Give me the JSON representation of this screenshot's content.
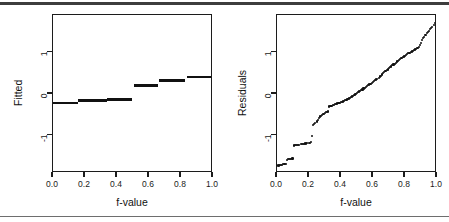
{
  "figure": {
    "background_color": "#ffffff",
    "ink_color": "#111111",
    "top_rule_color": "#3d3d3d",
    "bottom_rule_color": "#6e6e6e"
  },
  "panels": [
    {
      "name": "fitted-panel",
      "xlabel": "f-value",
      "ylabel": "Fitted",
      "x_ticks": [
        "0.0",
        "0.2",
        "0.4",
        "0.6",
        "0.8",
        "1.0"
      ],
      "y_ticks": [
        "1",
        "0",
        "-1"
      ]
    },
    {
      "name": "residuals-panel",
      "xlabel": "f-value",
      "ylabel": "Residuals",
      "x_ticks": [
        "0.0",
        "0.2",
        "0.4",
        "0.6",
        "0.8",
        "1.0"
      ],
      "y_ticks": [
        "1",
        "0",
        "-1"
      ]
    }
  ],
  "chart_data": [
    {
      "type": "line",
      "name": "fitted-panel",
      "title": "",
      "xlabel": "f-value",
      "ylabel": "Fitted",
      "xlim": [
        0.0,
        1.0
      ],
      "ylim": [
        -1.9,
        1.9
      ],
      "x_ticks": [
        0.0,
        0.2,
        0.4,
        0.6,
        0.8,
        1.0
      ],
      "y_ticks": [
        1,
        0,
        -1
      ],
      "grid": false,
      "legend": "none",
      "style": "step-segments",
      "segments": [
        {
          "x0": 0.0,
          "x1": 0.155,
          "y": -0.22
        },
        {
          "x0": 0.155,
          "x1": 0.335,
          "y": -0.16
        },
        {
          "x0": 0.335,
          "x1": 0.495,
          "y": -0.13
        },
        {
          "x0": 0.505,
          "x1": 0.655,
          "y": 0.2
        },
        {
          "x0": 0.665,
          "x1": 0.825,
          "y": 0.33
        },
        {
          "x0": 0.835,
          "x1": 1.0,
          "y": 0.41
        }
      ]
    },
    {
      "type": "scatter",
      "name": "residuals-panel",
      "title": "",
      "xlabel": "f-value",
      "ylabel": "Residuals",
      "xlim": [
        0.0,
        1.0
      ],
      "ylim": [
        -1.9,
        1.9
      ],
      "x_ticks": [
        0.0,
        0.2,
        0.4,
        0.6,
        0.8,
        1.0
      ],
      "y_ticks": [
        1,
        0,
        -1
      ],
      "grid": false,
      "legend": "none",
      "x": [
        0.005,
        0.012,
        0.019,
        0.026,
        0.033,
        0.04,
        0.047,
        0.054,
        0.062,
        0.069,
        0.076,
        0.083,
        0.09,
        0.097,
        0.105,
        0.112,
        0.119,
        0.126,
        0.133,
        0.14,
        0.148,
        0.155,
        0.162,
        0.169,
        0.176,
        0.183,
        0.19,
        0.198,
        0.205,
        0.212,
        0.219,
        0.226,
        0.233,
        0.24,
        0.248,
        0.255,
        0.262,
        0.269,
        0.276,
        0.283,
        0.291,
        0.298,
        0.305,
        0.312,
        0.319,
        0.326,
        0.334,
        0.341,
        0.348,
        0.355,
        0.362,
        0.369,
        0.377,
        0.384,
        0.391,
        0.398,
        0.405,
        0.412,
        0.42,
        0.427,
        0.434,
        0.441,
        0.448,
        0.455,
        0.463,
        0.47,
        0.477,
        0.484,
        0.491,
        0.498,
        0.506,
        0.513,
        0.52,
        0.527,
        0.534,
        0.541,
        0.549,
        0.556,
        0.563,
        0.57,
        0.577,
        0.584,
        0.592,
        0.599,
        0.606,
        0.613,
        0.62,
        0.627,
        0.635,
        0.642,
        0.649,
        0.656,
        0.663,
        0.67,
        0.678,
        0.685,
        0.692,
        0.699,
        0.706,
        0.713,
        0.721,
        0.728,
        0.735,
        0.742,
        0.749,
        0.756,
        0.764,
        0.771,
        0.778,
        0.785,
        0.792,
        0.799,
        0.807,
        0.814,
        0.821,
        0.828,
        0.835,
        0.842,
        0.85,
        0.857,
        0.864,
        0.871,
        0.878,
        0.885,
        0.893,
        0.9,
        0.907,
        0.914,
        0.921,
        0.928,
        0.936,
        0.943,
        0.95,
        0.957,
        0.964,
        0.971,
        0.979,
        0.986,
        0.993
      ],
      "y": [
        -1.72,
        -1.72,
        -1.71,
        -1.71,
        -1.7,
        -1.69,
        -1.69,
        -1.68,
        -1.58,
        -1.57,
        -1.57,
        -1.56,
        -1.56,
        -1.55,
        -1.24,
        -1.23,
        -1.23,
        -1.22,
        -1.22,
        -1.22,
        -1.21,
        -1.21,
        -1.2,
        -1.2,
        -1.19,
        -1.19,
        -1.18,
        -1.18,
        -1.17,
        -1.16,
        -1.02,
        -0.74,
        -0.72,
        -0.7,
        -0.66,
        -0.62,
        -0.58,
        -0.54,
        -0.52,
        -0.5,
        -0.48,
        -0.46,
        -0.44,
        -0.43,
        -0.42,
        -0.3,
        -0.29,
        -0.28,
        -0.27,
        -0.26,
        -0.25,
        -0.24,
        -0.23,
        -0.22,
        -0.21,
        -0.2,
        -0.19,
        -0.18,
        -0.16,
        -0.15,
        -0.14,
        -0.12,
        -0.11,
        -0.09,
        -0.07,
        -0.06,
        -0.04,
        -0.02,
        0.0,
        0.02,
        0.04,
        0.06,
        0.07,
        0.09,
        0.11,
        0.13,
        0.15,
        0.17,
        0.19,
        0.21,
        0.23,
        0.25,
        0.27,
        0.29,
        0.31,
        0.33,
        0.35,
        0.37,
        0.39,
        0.42,
        0.44,
        0.47,
        0.5,
        0.52,
        0.55,
        0.57,
        0.59,
        0.62,
        0.64,
        0.66,
        0.69,
        0.71,
        0.73,
        0.75,
        0.78,
        0.8,
        0.82,
        0.84,
        0.86,
        0.88,
        0.9,
        0.92,
        0.94,
        0.96,
        0.98,
        0.99,
        1.01,
        1.02,
        1.04,
        1.05,
        1.07,
        1.08,
        1.1,
        1.14,
        1.18,
        1.22,
        1.3,
        1.34,
        1.38,
        1.42,
        1.46,
        1.49,
        1.52,
        1.56,
        1.59,
        1.62,
        1.66,
        1.7,
        1.74
      ]
    }
  ]
}
